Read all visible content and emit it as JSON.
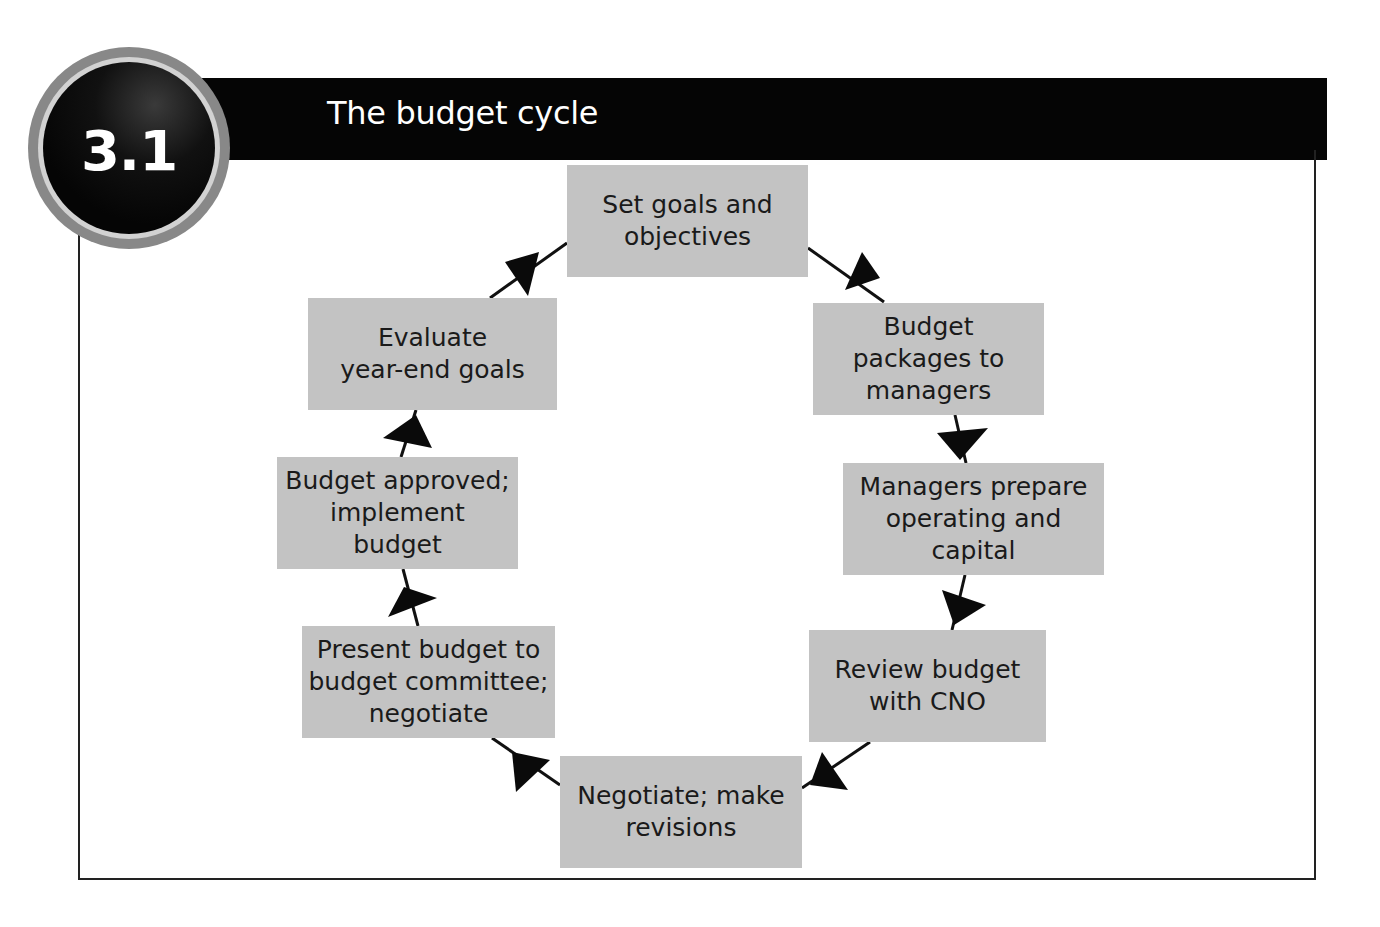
{
  "figure": {
    "number": "3.1",
    "title": "The budget cycle"
  },
  "colors": {
    "header_bg": "#050505",
    "box_fill": "#c3c3c3",
    "badge_outer": "#888888",
    "badge_ring": "#d2d2d2",
    "frame": "#222222",
    "arrow": "#111111"
  },
  "cycle": {
    "direction": "clockwise",
    "steps": [
      {
        "id": 1,
        "label": "Set goals and\nobjectives"
      },
      {
        "id": 2,
        "label": "Budget\npackages to\nmanagers"
      },
      {
        "id": 3,
        "label": "Managers prepare\noperating and\ncapital"
      },
      {
        "id": 4,
        "label": "Review budget\nwith CNO"
      },
      {
        "id": 5,
        "label": "Negotiate; make\nrevisions"
      },
      {
        "id": 6,
        "label": "Present budget to\nbudget committee;\nnegotiate"
      },
      {
        "id": 7,
        "label": "Budget approved;\nimplement\nbudget"
      },
      {
        "id": 8,
        "label": "Evaluate\nyear-end goals"
      }
    ],
    "connections": [
      {
        "from": 1,
        "to": 2
      },
      {
        "from": 2,
        "to": 3
      },
      {
        "from": 3,
        "to": 4
      },
      {
        "from": 4,
        "to": 5
      },
      {
        "from": 5,
        "to": 6
      },
      {
        "from": 6,
        "to": 7
      },
      {
        "from": 7,
        "to": 8
      },
      {
        "from": 8,
        "to": 1
      }
    ]
  }
}
